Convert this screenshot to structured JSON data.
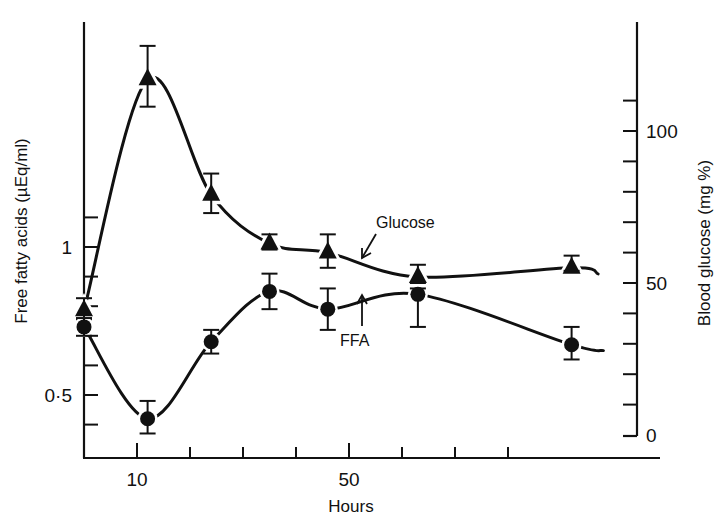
{
  "chart_data": {
    "type": "line",
    "title": "",
    "xlabel": "Hours",
    "ylabel_left": "Free fatty acids (µEq/ml)",
    "ylabel_right": "Blood glucose (mg %)",
    "x_ticks": [
      10,
      20,
      30,
      40,
      50,
      60,
      70,
      80
    ],
    "x_tick_labels": [
      {
        "value": 10,
        "label": "10"
      },
      {
        "value": 50,
        "label": "50"
      }
    ],
    "xlim": [
      0,
      108
    ],
    "ylim_left": [
      0.29,
      1.3
    ],
    "ylim_right": [
      0,
      135
    ],
    "left_ticks": [
      0.4,
      0.5,
      0.6,
      0.7,
      0.8,
      0.9,
      1.0,
      1.1
    ],
    "left_tick_labels": [
      {
        "value": 0.5,
        "label": "0·5"
      },
      {
        "value": 1.0,
        "label": "1"
      }
    ],
    "right_ticks": [
      0,
      10,
      20,
      30,
      40,
      50,
      60,
      70,
      80,
      90,
      100,
      110
    ],
    "right_tick_labels": [
      {
        "value": 0,
        "label": "0"
      },
      {
        "value": 50,
        "label": "50"
      },
      {
        "value": 100,
        "label": "100"
      }
    ],
    "grid": false,
    "legend": "inline annotations",
    "x": [
      0,
      12,
      24,
      35,
      46,
      63,
      92
    ],
    "series": [
      {
        "name": "Glucose",
        "axis": "right",
        "marker": "triangle",
        "values": [
          41,
          117,
          79,
          63,
          60,
          52,
          55
        ],
        "err_low": [
          38,
          108,
          73,
          61,
          55,
          50,
          54
        ],
        "err_high": [
          45,
          128,
          86,
          66,
          66,
          56,
          59
        ],
        "curve_end": {
          "x": 97,
          "y": 53
        }
      },
      {
        "name": "FFA",
        "axis": "left",
        "marker": "circle",
        "values": [
          0.73,
          0.42,
          0.68,
          0.85,
          0.79,
          0.84,
          0.67
        ],
        "err_low": [
          0.7,
          0.37,
          0.64,
          0.79,
          0.72,
          0.73,
          0.62
        ],
        "err_high": [
          0.76,
          0.48,
          0.72,
          0.91,
          0.86,
          0.86,
          0.73
        ],
        "curve_end": {
          "x": 98,
          "y": 0.65
        }
      }
    ],
    "annotations": [
      {
        "text": "Glucose",
        "series": "Glucose"
      },
      {
        "text": "FFA",
        "series": "FFA"
      }
    ]
  }
}
